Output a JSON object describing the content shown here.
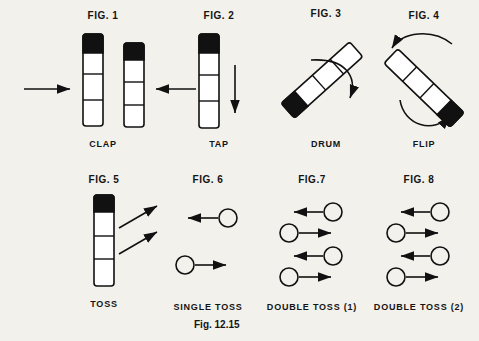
{
  "plate": {
    "caption": "Fig. 12.15",
    "background_color": "#f3f1ec",
    "ink_color": "#111111"
  },
  "figures": [
    {
      "id": "fig-1",
      "label": "FIG. 1",
      "caption": "CLAP",
      "description": "Two vertical sticks with black tips, horizontal arrows pointing inward toward each other",
      "sticks": 2,
      "arrows": [
        "left-to-right",
        "right-to-left"
      ]
    },
    {
      "id": "fig-2",
      "label": "FIG. 2",
      "caption": "TAP",
      "description": "Single vertical stick with black tip and a downward arrow beside it",
      "sticks": 1,
      "arrows": [
        "downward"
      ]
    },
    {
      "id": "fig-3",
      "label": "FIG. 3",
      "caption": "DRUM",
      "description": "Tilted stick with black tip at lower end and a curved rotation arrow",
      "sticks": 1,
      "arrows": [
        "curved-clockwise"
      ]
    },
    {
      "id": "fig-4",
      "label": "FIG. 4",
      "caption": "FLIP",
      "description": "Tilted stick with black tip at lower-left end and two curved flip arrows",
      "sticks": 1,
      "arrows": [
        "curved-over-top",
        "curved-under-bottom"
      ]
    },
    {
      "id": "fig-5",
      "label": "FIG. 5",
      "caption": "TOSS",
      "description": "Vertical stick with black tip and two arrows angling up to the right",
      "sticks": 1,
      "arrows": [
        "up-right-upper",
        "up-right-lower"
      ]
    },
    {
      "id": "fig-6",
      "label": "FIG. 6",
      "caption": "SINGLE TOSS",
      "description": "Circle with arrow pointing left above a circle with arrow pointing right",
      "rows": [
        {
          "circle": "right",
          "direction": "left"
        },
        {
          "circle": "left",
          "direction": "right"
        }
      ]
    },
    {
      "id": "fig-7",
      "label": "FIG.7",
      "caption": "DOUBLE TOSS (1)",
      "description": "Four rows of circles with arrows: left, right, left, right",
      "rows": [
        {
          "circle": "right",
          "direction": "left"
        },
        {
          "circle": "left",
          "direction": "right"
        },
        {
          "circle": "right",
          "direction": "left"
        },
        {
          "circle": "left",
          "direction": "right"
        }
      ]
    },
    {
      "id": "fig-8",
      "label": "FIG. 8",
      "caption": "DOUBLE TOSS (2)",
      "description": "Four rows of circles with arrows: left, right, left, right",
      "rows": [
        {
          "circle": "right",
          "direction": "left"
        },
        {
          "circle": "left",
          "direction": "right"
        },
        {
          "circle": "right",
          "direction": "left"
        },
        {
          "circle": "left",
          "direction": "right"
        }
      ]
    }
  ]
}
